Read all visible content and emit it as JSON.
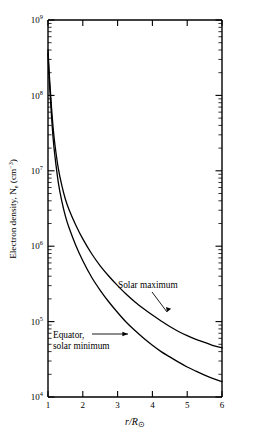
{
  "figure": {
    "background_color": "#ffffff",
    "line_color": "#000000"
  },
  "chart_data": {
    "type": "line",
    "title": "",
    "subtitle": "",
    "xlabel": "r/R⊙",
    "xlabel_parts": {
      "numerator": "r",
      "denominator": "R",
      "sun_symbol": "⊙"
    },
    "ylabel": "Electron density, Nₑ (cm⁻³)",
    "ylabel_parts": {
      "main": "Electron density, N",
      "sub": "e",
      "unit_open": " (cm",
      "unit_exp": "−3",
      "unit_close": ")"
    },
    "xscale": "linear",
    "yscale": "log",
    "xlim": [
      1,
      6
    ],
    "ylim": [
      10000,
      1000000000
    ],
    "grid": false,
    "legend_position": "inline-annotations",
    "x_ticks": [
      1,
      2,
      3,
      4,
      5,
      6
    ],
    "x_tick_labels": [
      "1",
      "2",
      "3",
      "4",
      "5",
      "6"
    ],
    "y_ticks": [
      10000,
      100000,
      1000000,
      10000000,
      100000000,
      1000000000
    ],
    "y_tick_labels": [
      "10⁴",
      "10⁵",
      "10⁶",
      "10⁷",
      "10⁸",
      "10⁹"
    ],
    "y_tick_mantissas": [
      "10",
      "10",
      "10",
      "10",
      "10",
      "10"
    ],
    "y_tick_exponents": [
      "4",
      "5",
      "6",
      "7",
      "8",
      "9"
    ],
    "minor_ticks": "log decades 2..9",
    "series": [
      {
        "name": "Solar maximum",
        "label": "Solar maximum",
        "x": [
          1.0,
          1.03,
          1.06,
          1.1,
          1.15,
          1.2,
          1.3,
          1.4,
          1.5,
          1.6,
          1.8,
          2.0,
          2.25,
          2.5,
          2.75,
          3.0,
          3.25,
          3.5,
          3.75,
          4.0,
          4.25,
          4.5,
          4.75,
          5.0,
          5.25,
          5.5,
          5.75,
          6.0
        ],
        "y": [
          400000000.0,
          220000000.0,
          130000000.0,
          70000000.0,
          36000000.0,
          22000000.0,
          10500000.0,
          6300000.0,
          4200000.0,
          3100000.0,
          1900000.0,
          1250000.0,
          800000.0,
          550000.0,
          400000.0,
          300000.0,
          230000.0,
          182000.0,
          148000.0,
          122000.0,
          102000.0,
          86000.0,
          74000.0,
          65000.0,
          58000.0,
          53000.0,
          48000.0,
          45000.0
        ]
      },
      {
        "name": "Equator, solar minimum",
        "label": "Equator, solar minimum",
        "x": [
          1.0,
          1.03,
          1.06,
          1.1,
          1.15,
          1.2,
          1.3,
          1.4,
          1.5,
          1.6,
          1.8,
          2.0,
          2.25,
          2.5,
          2.75,
          3.0,
          3.25,
          3.5,
          3.75,
          4.0,
          4.25,
          4.5,
          4.75,
          5.0,
          5.25,
          5.5,
          5.75,
          6.0
        ],
        "y": [
          360000000.0,
          185000000.0,
          105000000.0,
          54000000.0,
          26000000.0,
          15500000.0,
          6800000.0,
          3900000.0,
          2500000.0,
          1780000.0,
          1020000.0,
          640000.0,
          390000.0,
          260000.0,
          182000.0,
          132000.0,
          98000.0,
          76000.0,
          60000.0,
          48500.0,
          40000.0,
          34000.0,
          29000.0,
          25000.0,
          22000.0,
          19500.0,
          17500.0,
          16000.0
        ]
      }
    ],
    "annotations": [
      {
        "text": "Solar maximum",
        "target_series": "Solar maximum",
        "x_text": 3.55,
        "y_text": 260000.0,
        "leader": true
      },
      {
        "text_line1": "Equator,",
        "text_line2": "solar minimum",
        "text": "Equator, solar minimum",
        "target_series": "Equator, solar minimum",
        "x_text": 1.95,
        "y_text": 50000.0,
        "leader": true,
        "arrow": true
      }
    ]
  }
}
